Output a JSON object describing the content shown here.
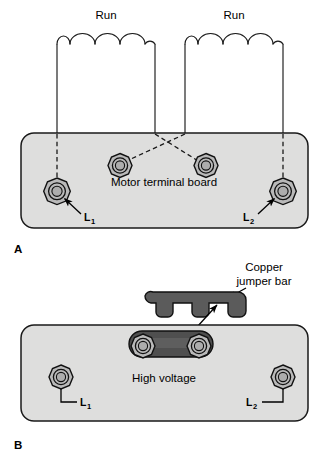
{
  "figure": {
    "title_panels": [
      "A",
      "B"
    ],
    "width": 329,
    "height": 461
  },
  "colors": {
    "board_fill": "#dededd",
    "board_stroke": "#1a1a1a",
    "nut_fill": "#b9b9b9",
    "nut_inner_fill": "#adadad",
    "jumper_fill": "#5b5b5b",
    "jumper_dark_fill": "#4f4f4f",
    "line": "#1a1a1a",
    "text": "#000000",
    "background": "#ffffff"
  },
  "panel_a": {
    "panel_label": "A",
    "coil_left_label": "Run",
    "coil_right_label": "Run",
    "board_label": "Motor terminal board",
    "terminal_left_label": "L",
    "terminal_left_sub": "1",
    "terminal_right_label": "L",
    "terminal_right_sub": "2",
    "coil_arch_count": 4,
    "terminal_count": 4,
    "connection_style": "crossed-dashed"
  },
  "panel_b": {
    "panel_label": "B",
    "callout_line1": "Copper",
    "callout_line2": "jumper bar",
    "board_label": "High voltage",
    "terminal_left_label": "L",
    "terminal_left_sub": "1",
    "terminal_right_label": "L",
    "terminal_right_sub": "2",
    "terminal_count": 4,
    "jumper_notch_count": 2
  }
}
